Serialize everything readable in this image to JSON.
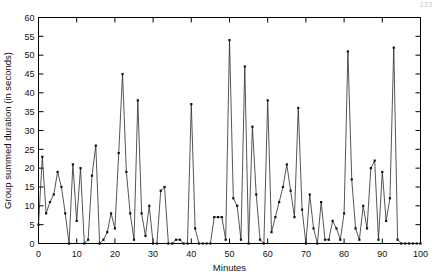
{
  "page": {
    "corner_note": "223"
  },
  "chart_data": {
    "type": "line",
    "title": "",
    "xlabel": "Minutes",
    "ylabel": "Group summed duration (in seconds)",
    "xlim": [
      0,
      100
    ],
    "ylim": [
      0,
      60
    ],
    "xticks": [
      0,
      10,
      20,
      30,
      40,
      50,
      60,
      70,
      80,
      90,
      100
    ],
    "yticks": [
      0,
      5,
      10,
      15,
      20,
      25,
      30,
      35,
      40,
      45,
      50,
      55,
      60
    ],
    "xtick_labels": [
      "0",
      "10",
      "20",
      "30",
      "40",
      "50",
      "60",
      "70",
      "80",
      "90",
      "100"
    ],
    "ytick_labels": [
      "0",
      "5",
      "10",
      "15",
      "20",
      "25",
      "30",
      "35",
      "40",
      "45",
      "50",
      "55",
      "60"
    ],
    "grid": false,
    "legend": null,
    "markers": true,
    "marker_style": "square",
    "line_color": "#2a2a2a",
    "x": [
      0,
      1,
      2,
      3,
      4,
      5,
      6,
      7,
      8,
      9,
      10,
      11,
      12,
      13,
      14,
      15,
      16,
      17,
      18,
      19,
      20,
      21,
      22,
      23,
      24,
      25,
      26,
      27,
      28,
      29,
      30,
      31,
      32,
      33,
      34,
      35,
      36,
      37,
      38,
      39,
      40,
      41,
      42,
      43,
      44,
      45,
      46,
      47,
      48,
      49,
      50,
      51,
      52,
      53,
      54,
      55,
      56,
      57,
      58,
      59,
      60,
      61,
      62,
      63,
      64,
      65,
      66,
      67,
      68,
      69,
      70,
      71,
      72,
      73,
      74,
      75,
      76,
      77,
      78,
      79,
      80,
      81,
      82,
      83,
      84,
      85,
      86,
      87,
      88,
      89,
      90,
      91,
      92,
      93,
      94,
      95,
      96,
      97,
      98,
      99,
      100
    ],
    "values": [
      5,
      23,
      8,
      11,
      13,
      19,
      15,
      8,
      0,
      21,
      6,
      20,
      0,
      1,
      18,
      26,
      0,
      1,
      3,
      8,
      4,
      24,
      45,
      19,
      8,
      1,
      38,
      8,
      2,
      10,
      0,
      0,
      14,
      15,
      0,
      0,
      1,
      1,
      0,
      0,
      37,
      4,
      0,
      0,
      0,
      0,
      7,
      7,
      7,
      1,
      54,
      12,
      10,
      1,
      47,
      0,
      31,
      13,
      1,
      0,
      38,
      3,
      7,
      11,
      15,
      21,
      14,
      7,
      36,
      9,
      0,
      13,
      4,
      0,
      11,
      1,
      1,
      6,
      4,
      1,
      8,
      51,
      17,
      4,
      1,
      10,
      4,
      20,
      22,
      1,
      19,
      6,
      12,
      52,
      1,
      0,
      0,
      0,
      0,
      0,
      0
    ]
  }
}
